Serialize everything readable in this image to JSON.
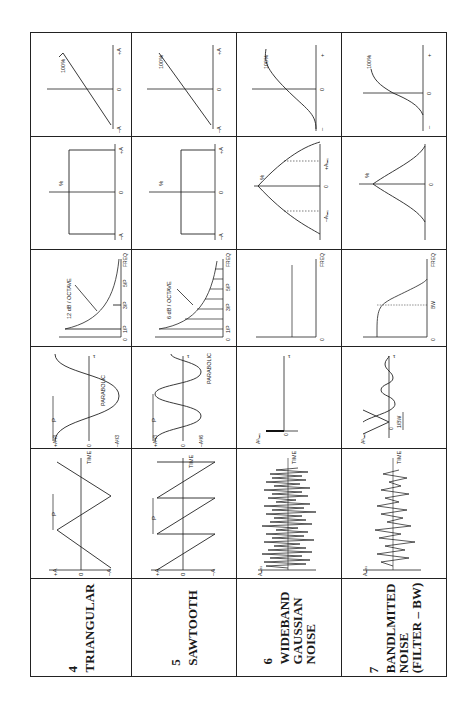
{
  "table": {
    "orientation": "rotated-90-ccw",
    "row_headers_implied": [
      "Time waveform",
      "Autocorrelation",
      "Power spectrum",
      "Probability density",
      "Cumulative probability"
    ],
    "signals": [
      {
        "number": "4",
        "name_lines": [
          "TRIANGULAR"
        ],
        "waveform": {
          "ymax": "+A",
          "zero": "0",
          "ymin": "–A",
          "period": "P",
          "axis": "TIME"
        },
        "autocorrelation": {
          "ymax": "+A²/3",
          "zero": "0",
          "ymin": "–A²/3",
          "period": "P",
          "shape": "PARABOLIC",
          "axis": "τ"
        },
        "spectrum": {
          "slope": "12 dB / OCTAVE",
          "ticks": [
            "0",
            "1/P",
            "3/P",
            "5/P"
          ],
          "axis": "FREQ"
        },
        "pdf": {
          "ylabel": "%",
          "left": "–A",
          "zero": "0",
          "right": "+A"
        },
        "cdf": {
          "ylabel": "100%",
          "left": "–A",
          "zero": "0",
          "right": "+A"
        }
      },
      {
        "number": "5",
        "name_lines": [
          "SAWTOOTH"
        ],
        "waveform": {
          "ymax": "+A",
          "zero": "0",
          "ymin": "–A",
          "period": "P",
          "axis": "TIME"
        },
        "autocorrelation": {
          "ymax": "+A²/3",
          "zero": "0",
          "ymin": "–A²/6",
          "period": "P",
          "shape": "PARABOLIC",
          "axis": "τ"
        },
        "spectrum": {
          "slope": "6 dB / OCTAVE",
          "ticks": [
            "0",
            "1/P",
            "3/P",
            "5/P"
          ],
          "axis": "FREQ"
        },
        "pdf": {
          "ylabel": "%",
          "left": "–A",
          "zero": "0",
          "right": "+A"
        },
        "cdf": {
          "ylabel": "100%",
          "left": "–A",
          "zero": "0",
          "right": "+A"
        }
      },
      {
        "number": "6",
        "name_lines": [
          "WIDEBAND",
          "GAUSSIAN",
          "NOISE"
        ],
        "waveform": {
          "ylabel": "Aₘₐₓ",
          "axis": "TIME"
        },
        "autocorrelation": {
          "ylabel": "A²ᵣₘₛ",
          "zero": "0",
          "axis": "τ"
        },
        "spectrum": {
          "zero": "0",
          "axis": "FREQ"
        },
        "pdf": {
          "ylabel": "%",
          "left": "–Aᵣₘₛ",
          "zero": "0",
          "right": "+Aᵣₘₛ"
        },
        "cdf": {
          "ylabel": "100%",
          "left": "–",
          "zero": "0",
          "right": "+"
        }
      },
      {
        "number": "7",
        "name_lines": [
          "BANDLMITED",
          "NOISE",
          "(FILTER – BW)"
        ],
        "waveform": {
          "ylabel": "Aₘₐₓ",
          "axis": "TIME"
        },
        "autocorrelation": {
          "ylabel": "A²ᵣₘₛ",
          "zero": "0",
          "bw": "1/BW",
          "axis": "τ"
        },
        "spectrum": {
          "zero": "0",
          "bw": "BW",
          "axis": "FREQ"
        },
        "pdf": {
          "ylabel": "%",
          "zero": "0"
        },
        "cdf": {
          "ylabel": "100%",
          "left": "–",
          "zero": "0",
          "right": "+"
        }
      }
    ]
  }
}
